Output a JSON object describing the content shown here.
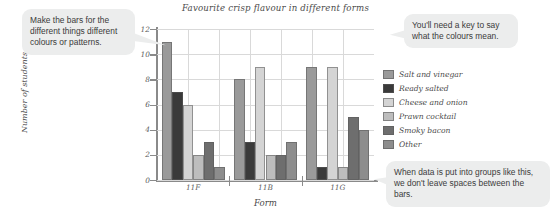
{
  "callouts": {
    "bars": "Make the bars for the different things different colours or patterns.",
    "key": "You'll need a key to say what the colours mean.",
    "groups": "When data is put into groups like this, we don't leave spaces between the bars."
  },
  "chart_data": {
    "type": "bar",
    "title": "Favourite crisp flavour in different forms",
    "xlabel": "Form",
    "ylabel": "Number of students",
    "grid": true,
    "legend_position": "right",
    "ylim": [
      0,
      12
    ],
    "yticks": [
      0,
      2,
      4,
      6,
      8,
      10,
      12
    ],
    "ytick_labels": [
      "0",
      "2",
      "4",
      "6",
      "8",
      "10",
      "12"
    ],
    "categories": [
      "11F",
      "11B",
      "11G"
    ],
    "series": [
      {
        "name": "Salt and vinegar",
        "color": "#9a9a9a",
        "values": [
          11,
          8,
          9
        ]
      },
      {
        "name": "Ready salted",
        "color": "#3a3a3a",
        "values": [
          7,
          3,
          1
        ]
      },
      {
        "name": "Cheese and onion",
        "color": "#d4d4d4",
        "values": [
          6,
          9,
          9
        ]
      },
      {
        "name": "Prawn cocktail",
        "color": "#bdbdbd",
        "values": [
          2,
          2,
          1
        ]
      },
      {
        "name": "Smoky bacon",
        "color": "#6e6e6e",
        "values": [
          3,
          2,
          5
        ]
      },
      {
        "name": "Other",
        "color": "#8d8d8d",
        "values": [
          1,
          3,
          4
        ]
      }
    ]
  }
}
